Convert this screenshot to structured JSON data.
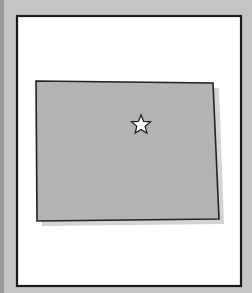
{
  "map": {
    "region": "state-outline",
    "marker": "capital-star",
    "colors": {
      "background": "#c4c4c4",
      "frame_fill": "#ffffff",
      "frame_stroke": "#1a1a1a",
      "region_fill": "#b3b3b3",
      "region_shadow": "#d6d6d6",
      "region_stroke": "#222222",
      "star_fill": "#ffffff",
      "star_stroke": "#222222"
    }
  }
}
